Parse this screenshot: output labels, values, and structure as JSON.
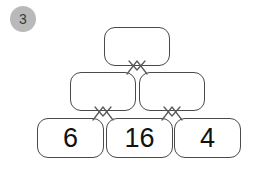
{
  "badge": {
    "label": "3"
  },
  "puzzle": {
    "type": "number-pyramid",
    "rows": [
      {
        "name": "top",
        "cells": [
          {
            "id": "top-1",
            "value": "",
            "empty": true,
            "x": 104,
            "y": 27,
            "w": 66,
            "h": 39
          }
        ]
      },
      {
        "name": "middle",
        "cells": [
          {
            "id": "mid-1",
            "value": "",
            "empty": true,
            "x": 70,
            "y": 72,
            "w": 66,
            "h": 39
          },
          {
            "id": "mid-2",
            "value": "",
            "empty": true,
            "x": 139,
            "y": 72,
            "w": 66,
            "h": 39
          }
        ]
      },
      {
        "name": "bottom",
        "cells": [
          {
            "id": "bot-1",
            "value": "6",
            "empty": false,
            "x": 37,
            "y": 118,
            "w": 67,
            "h": 40
          },
          {
            "id": "bot-2",
            "value": "16",
            "empty": false,
            "x": 106,
            "y": 118,
            "w": 67,
            "h": 40
          },
          {
            "id": "bot-3",
            "value": "4",
            "empty": false,
            "x": 174,
            "y": 118,
            "w": 67,
            "h": 40
          }
        ]
      }
    ],
    "connectors": [
      {
        "id": "conn-top",
        "x": 124,
        "y": 57
      },
      {
        "id": "conn-bottom-left",
        "x": 90,
        "y": 103
      },
      {
        "id": "conn-bottom-right",
        "x": 159,
        "y": 103
      }
    ]
  },
  "colors": {
    "badge_background": "#b9b9b9",
    "badge_text": "#3a3a3a",
    "cell_border": "#4a4a4a",
    "cell_background": "#ffffff",
    "cell_text": "#111111",
    "connector_stroke": "#5a5a5a",
    "page_background": "#ffffff"
  }
}
